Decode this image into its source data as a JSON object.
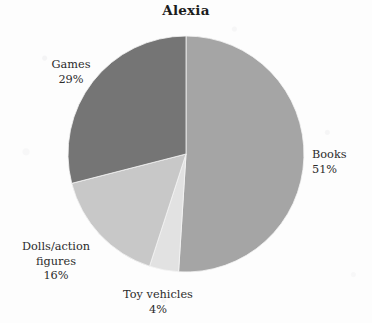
{
  "chart_data": {
    "type": "pie",
    "title": "Alexia",
    "xlabel": "",
    "ylabel": "",
    "legend_position": "none",
    "grid": false,
    "start_angle_deg": 0,
    "direction": "clockwise",
    "categories": [
      "Books",
      "Toy vehicles",
      "Dolls/action figures",
      "Games"
    ],
    "values": [
      51,
      4,
      16,
      29
    ],
    "value_unit": "%",
    "colors": [
      "#a5a5a5",
      "#e2e2e2",
      "#c8c8c8",
      "#757575"
    ],
    "slices": [
      {
        "name": "Books",
        "value": 51,
        "value_label": "51%",
        "color": "#a5a5a5",
        "label_text": "Books\n51%"
      },
      {
        "name": "Toy vehicles",
        "value": 4,
        "value_label": "4%",
        "color": "#e2e2e2",
        "label_text": "Toy vehicles\n4%"
      },
      {
        "name": "Dolls/action figures",
        "value": 16,
        "value_label": "16%",
        "color": "#c8c8c8",
        "label_text": "Dolls/action\nfigures\n16%"
      },
      {
        "name": "Games",
        "value": 29,
        "value_label": "29%",
        "color": "#757575",
        "label_text": "Games\n29%"
      }
    ]
  },
  "geometry": {
    "center_x": 186,
    "center_y": 154,
    "radius": 118
  },
  "colors": {
    "background": "#fdfdfd",
    "title_text": "#1c1c1c",
    "label_text": "#2b2b2b",
    "slice_outline": "#f4f4f4"
  }
}
